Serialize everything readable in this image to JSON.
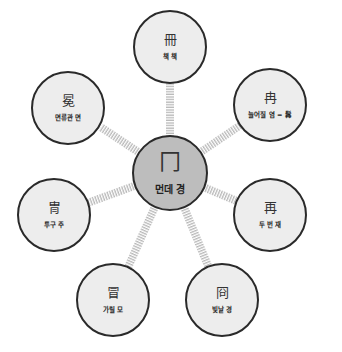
{
  "diagram": {
    "type": "radial-mind-map",
    "colors": {
      "hub_fill": "#bdbdbd",
      "leaf_fill": "#ededed",
      "border": "#2a2a2a",
      "connector": "#b8b8b8",
      "background": "#ffffff"
    },
    "hub": {
      "hanja": "冂",
      "label": "먼데 경"
    },
    "nodes": [
      {
        "id": "top",
        "hanja": "冊",
        "label": "책 책"
      },
      {
        "id": "upper-right",
        "hanja": "冉",
        "label": "늘어질 염 = 髥"
      },
      {
        "id": "right",
        "hanja": "再",
        "label": "두 번 재"
      },
      {
        "id": "lower-right",
        "hanja": "冏",
        "label": "빛날 경"
      },
      {
        "id": "lower-left",
        "hanja": "冒",
        "label": "가릴 모"
      },
      {
        "id": "left",
        "hanja": "冑",
        "label": "투구 주"
      },
      {
        "id": "upper-left",
        "hanja": "冕",
        "label": "면류관 면"
      }
    ]
  }
}
